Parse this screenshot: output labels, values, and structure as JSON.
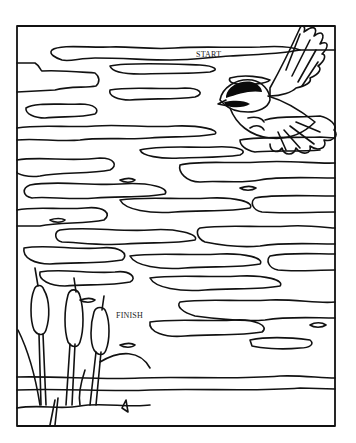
{
  "page": {
    "type": "maze-coloring-page"
  },
  "labels": {
    "start": "START",
    "finish": "FINISH"
  },
  "colors": {
    "ink": "#111111",
    "paper": "#ffffff",
    "bird_cap": "#0a0a0a"
  },
  "elements": {
    "frame": "rectangular border",
    "bird": "black-capped chickadee in flight, upper right",
    "cattails": 3,
    "water": "wavy ripple shapes forming maze paths"
  }
}
